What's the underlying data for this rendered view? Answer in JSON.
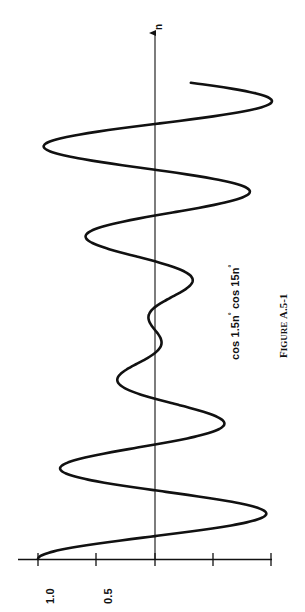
{
  "figure": {
    "caption_prefix": "F",
    "caption_smallcaps": "IGURE",
    "caption_number": "A.5-1",
    "caption_full": "FIGURE A.5-1",
    "curve_label_plain": "cos 1.5n° cos 15n°",
    "curve_label_parts": {
      "a_text": "cos 1.5n",
      "a_sup": "°",
      "b_text": " cos 15n",
      "b_sup": "°"
    },
    "axis_name": "n",
    "orientation": "rotated-90-ccw",
    "background_color": "#ffffff",
    "ink_color": "#111111"
  },
  "axis": {
    "value_tick_labels": [
      "1.0",
      "0.5"
    ],
    "value_ticks": [
      1.0,
      0.5,
      0.0,
      -0.5
    ],
    "value_axis_min": -0.75,
    "value_axis_max": 1.1
  },
  "chart_data": {
    "type": "line",
    "title": "",
    "subtitle": "",
    "xlabel": "n",
    "ylabel": "cos 1.5n° cos 15n°",
    "grid": false,
    "legend": "none",
    "annotations": [
      "cos 1.5n° cos 15n°",
      "FIGURE A.5-1"
    ],
    "orientation": "n axis vertical (pointing up), amplitude axis horizontal",
    "xlim": [
      0,
      125
    ],
    "ylim": [
      -1.0,
      1.0
    ],
    "yticks": [
      1.0,
      0.5,
      0.0,
      -0.5
    ],
    "ytick_labels": [
      "1.0",
      "0.5",
      "",
      ""
    ],
    "formula": "y = cos(1.5*n deg) * cos(15*n deg)",
    "series": [
      {
        "name": "cos 1.5n° cos 15n°",
        "x": [
          0,
          2,
          4,
          6,
          8,
          10,
          12,
          14,
          16,
          18,
          20,
          22,
          24,
          26,
          28,
          30,
          32,
          34,
          36,
          38,
          40,
          42,
          44,
          46,
          48,
          50,
          52,
          54,
          56,
          58,
          60,
          62,
          64,
          66,
          68,
          70,
          72,
          74,
          76,
          78,
          80,
          82,
          84,
          86,
          88,
          90,
          92,
          94,
          96,
          98,
          100,
          102,
          104,
          106,
          108,
          110,
          112,
          114,
          116,
          118,
          120
        ],
        "values": [
          1.0,
          0.86,
          0.5,
          0.05,
          -0.41,
          -0.73,
          -0.87,
          -0.8,
          -0.54,
          -0.14,
          0.29,
          0.64,
          0.83,
          0.82,
          0.61,
          0.26,
          -0.16,
          -0.52,
          -0.75,
          -0.79,
          -0.64,
          -0.34,
          0.04,
          0.4,
          0.66,
          0.74,
          0.63,
          0.37,
          0.01,
          -0.34,
          -0.59,
          -0.68,
          -0.59,
          -0.36,
          -0.04,
          0.28,
          0.52,
          0.62,
          0.54,
          0.33,
          0.04,
          -0.25,
          -0.45,
          -0.53,
          -0.46,
          -0.28,
          -0.04,
          0.21,
          0.39,
          0.45,
          0.39,
          0.23,
          0.02,
          -0.18,
          -0.33,
          -0.38,
          -0.32,
          -0.18,
          -0.01,
          0.15,
          0.27
        ]
      }
    ]
  }
}
